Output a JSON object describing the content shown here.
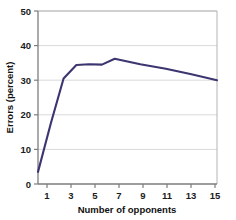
{
  "chart_data": {
    "type": "line",
    "title": "",
    "subtitle": "",
    "xlabel": "Number of opponents",
    "ylabel": "Errors (percent)",
    "xlim": [
      1,
      15
    ],
    "ylim": [
      0,
      50
    ],
    "xticks": [
      1,
      3,
      5,
      7,
      9,
      11,
      13,
      15
    ],
    "xtick_labels": [
      "1",
      "3",
      "5",
      "7",
      "9",
      "11",
      "13",
      "15"
    ],
    "yticks": [
      0,
      10,
      20,
      30,
      40,
      50
    ],
    "ytick_labels": [
      "0",
      "10",
      "20",
      "30",
      "40",
      "50"
    ],
    "grid": "horizontal",
    "legend": "none",
    "line_color": "#3b3570",
    "line_width": 2.1,
    "background_color": "#ffffff",
    "axis_color": "#8c8c8c",
    "grid_color": "#d9d9d9",
    "series": [
      {
        "name": "Errors",
        "x": [
          1,
          2,
          3,
          4,
          5,
          6,
          7,
          9,
          11,
          13,
          15
        ],
        "values": [
          3.5,
          17.5,
          30.5,
          34.4,
          34.6,
          34.5,
          36.2,
          34.6,
          33.3,
          31.7,
          30.0
        ]
      }
    ],
    "annotations": []
  },
  "axes": {
    "x_title": "Number of opponents",
    "y_title": "Errors (percent)"
  },
  "corner": {
    "mark": ""
  }
}
